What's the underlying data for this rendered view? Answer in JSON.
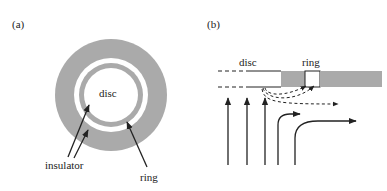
{
  "figure": {
    "panel_a": {
      "label": "(a)",
      "disc_label": "disc",
      "insulator_label": "insulator",
      "ring_label": "ring"
    },
    "panel_b": {
      "label": "(b)",
      "disc_label": "disc",
      "ring_label": "ring"
    },
    "colors": {
      "conductor_gray": "#aaaaaa",
      "background": "#ffffff",
      "arrow": "#222222"
    }
  }
}
